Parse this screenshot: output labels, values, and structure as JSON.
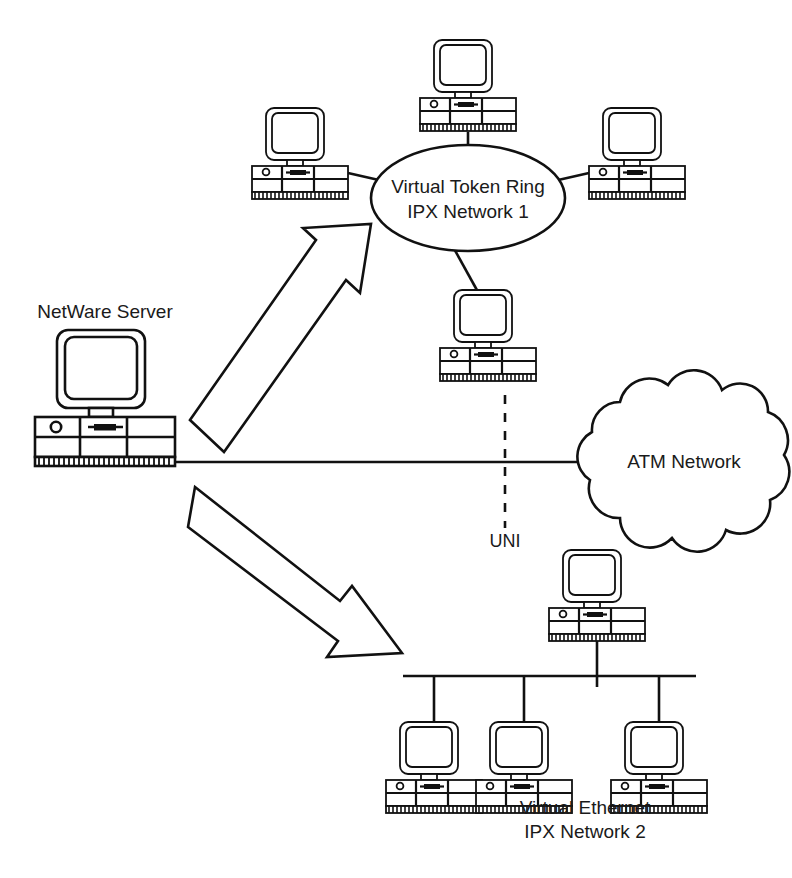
{
  "diagram": {
    "background_color": "#ffffff",
    "line_color": "#111111",
    "text_color": "#1a1a1a"
  },
  "labels": {
    "server": "NetWare Server",
    "token_ring_line1": "Virtual Token Ring",
    "token_ring_line2": "IPX Network 1",
    "atm_cloud": "ATM Network",
    "uni": "UNI",
    "ethernet_line1": "Virtual Ethernet",
    "ethernet_line2": "IPX Network 2"
  },
  "nodes": [
    {
      "id": "netware-server",
      "label": "NetWare Server",
      "kind": "server-computer",
      "x": 105,
      "y": 395
    },
    {
      "id": "tr-ws-top",
      "label": "",
      "kind": "workstation",
      "x": 468,
      "y": 85
    },
    {
      "id": "tr-ws-left",
      "label": "",
      "kind": "workstation",
      "x": 300,
      "y": 153
    },
    {
      "id": "tr-ws-right",
      "label": "",
      "kind": "workstation",
      "x": 637,
      "y": 153
    },
    {
      "id": "tr-ws-bottom",
      "label": "",
      "kind": "workstation",
      "x": 488,
      "y": 315
    },
    {
      "id": "eth-ws-top",
      "label": "",
      "kind": "workstation",
      "x": 597,
      "y": 595
    },
    {
      "id": "eth-ws-1",
      "label": "",
      "kind": "workstation",
      "x": 434,
      "y": 745
    },
    {
      "id": "eth-ws-2",
      "label": "",
      "kind": "workstation",
      "x": 524,
      "y": 745
    },
    {
      "id": "eth-ws-3",
      "label": "",
      "kind": "workstation",
      "x": 659,
      "y": 745
    }
  ],
  "clouds": [
    {
      "id": "atm-network",
      "label": "ATM Network",
      "cx": 683,
      "cy": 462,
      "rx": 108,
      "ry": 90
    }
  ],
  "ellipses": [
    {
      "id": "virtual-token-ring",
      "label": "Virtual Token Ring IPX Network 1",
      "cx": 468,
      "cy": 198,
      "rx": 97,
      "ry": 53
    }
  ],
  "links": [
    {
      "id": "server-to-atm",
      "from": "netware-server",
      "to": "atm-network",
      "style": "solid"
    },
    {
      "id": "uni-demarcation",
      "label": "UNI",
      "style": "dashed-vertical"
    },
    {
      "id": "server-to-token-ring",
      "from": "netware-server",
      "to": "virtual-token-ring",
      "style": "block-arrow"
    },
    {
      "id": "server-to-ethernet",
      "from": "netware-server",
      "to": "ethernet-bus",
      "style": "block-arrow"
    },
    {
      "id": "ethernet-bus",
      "label": "Virtual Ethernet IPX Network 2",
      "style": "bus"
    }
  ],
  "icons": {
    "server": "server-computer-icon",
    "workstation": "workstation-computer-icon",
    "cloud": "network-cloud-icon",
    "arrow": "block-arrow-icon"
  }
}
